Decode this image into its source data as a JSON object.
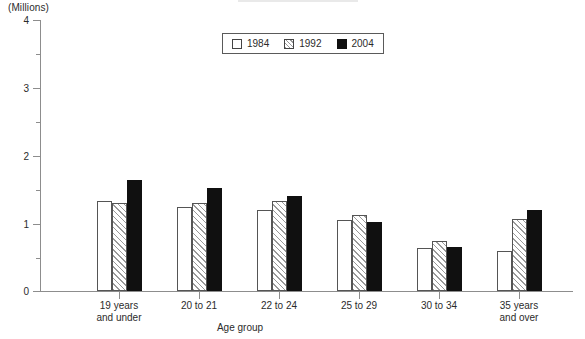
{
  "chart_data": {
    "type": "bar",
    "title": "",
    "xlabel": "Age group",
    "ylabel": "(Millions)",
    "ylim": [
      0,
      4
    ],
    "y_major_ticks": [
      "0",
      "1",
      "2",
      "3",
      "4"
    ],
    "y_minor_ticks": [
      0.5,
      1.5,
      2.5,
      3.5
    ],
    "grid": false,
    "legend_position": "top-center",
    "categories": [
      "19 years\nand under",
      "20 to 21",
      "22 to 24",
      "25 to 29",
      "30 to 34",
      "35 years\nand over"
    ],
    "series": [
      {
        "name": "1984",
        "fill": "white-outline",
        "values": [
          1.32,
          1.23,
          1.19,
          1.04,
          0.63,
          0.59
        ]
      },
      {
        "name": "1992",
        "fill": "diagonal-hatch",
        "values": [
          1.29,
          1.29,
          1.32,
          1.12,
          0.74,
          1.06
        ]
      },
      {
        "name": "2004",
        "fill": "solid-black",
        "values": [
          1.63,
          1.51,
          1.4,
          1.01,
          0.65,
          1.19
        ]
      }
    ]
  },
  "axis": {
    "unit_caption": "(Millions)",
    "x_title": "Age group",
    "y_ticks": [
      "4",
      "3",
      "2",
      "1",
      "0"
    ]
  },
  "legend": {
    "items": [
      {
        "label": "1984"
      },
      {
        "label": "1992"
      },
      {
        "label": "2004"
      }
    ]
  },
  "colors": {
    "axis": "#8d8d8d",
    "bar_outline": "#555555",
    "bar_solid": "#101010",
    "hatch": "#9a9a9a",
    "text": "#2b2b2b",
    "background": "#ffffff"
  }
}
